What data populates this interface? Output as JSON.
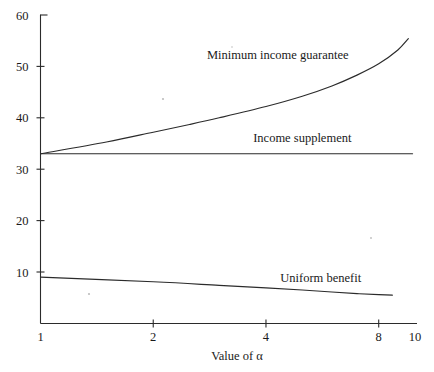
{
  "chart_data": {
    "type": "line",
    "title": "",
    "xlabel": "Value of α",
    "ylabel": "",
    "xscale": "log",
    "xlim": [
      1,
      10
    ],
    "ylim": [
      0,
      60
    ],
    "x_ticks": [
      1,
      2,
      4,
      8,
      10
    ],
    "x_tick_labels": [
      "1",
      "2",
      "4",
      "8",
      "10"
    ],
    "y_ticks": [
      10,
      20,
      30,
      40,
      50,
      60
    ],
    "y_tick_labels": [
      "10",
      "20",
      "30",
      "40",
      "50",
      "60"
    ],
    "grid": false,
    "legend": "inline-labels",
    "series": [
      {
        "name": "Minimum income guarantee",
        "label_x": 4.3,
        "label_y": 51.5,
        "x": [
          1,
          1.5,
          2,
          2.5,
          3,
          4,
          5,
          6,
          7,
          8,
          9,
          9.6
        ],
        "values": [
          33.0,
          35.3,
          37.2,
          38.7,
          40.0,
          42.2,
          44.2,
          46.2,
          48.3,
          50.5,
          53.2,
          55.4
        ]
      },
      {
        "name": "Income supplement",
        "label_x": 5.0,
        "label_y": 35.3,
        "x": [
          1,
          9.85
        ],
        "values": [
          33.0,
          33.0
        ]
      },
      {
        "name": "Uniform benefit",
        "label_x": 5.6,
        "label_y": 8.0,
        "x": [
          1,
          2,
          3,
          4,
          5,
          6,
          7,
          8,
          8.7
        ],
        "values": [
          9.0,
          8.1,
          7.4,
          6.9,
          6.5,
          6.1,
          5.8,
          5.6,
          5.5
        ]
      }
    ]
  },
  "axes": {
    "x_axis_name": "x-axis",
    "y_axis_name": "y-axis"
  },
  "colors": {
    "line": "#2b2b2b",
    "text": "#1a1a1a",
    "background": "#ffffff"
  }
}
